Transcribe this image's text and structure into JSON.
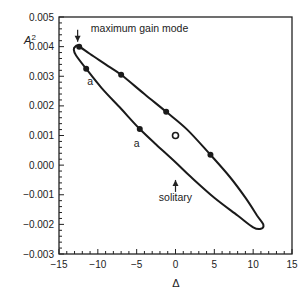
{
  "chart_data": {
    "type": "line",
    "title": "",
    "xlabel": "Δ",
    "ylabel": "A²",
    "xlim": [
      -15,
      15
    ],
    "ylim": [
      -0.003,
      0.005
    ],
    "x_ticks": [
      -15,
      -10,
      -5,
      0,
      5,
      10,
      15
    ],
    "x_tick_labels": [
      "−15",
      "−10",
      "−5",
      "0",
      "5",
      "10",
      "15"
    ],
    "y_ticks": [
      0.005,
      0.004,
      0.003,
      0.002,
      0.001,
      0.0,
      -0.001,
      -0.002,
      -0.003
    ],
    "y_tick_labels": [
      "0.005",
      "0.004",
      "0.003",
      "0.002",
      "0.001",
      "0.000",
      "−0.001",
      "−0.002",
      "−0.003"
    ],
    "grid": false,
    "series": [
      {
        "name": "closed curve (ellipse)",
        "style": "line",
        "points": [
          [
            -12.5,
            0.00402
          ],
          [
            -11.0,
            0.00375
          ],
          [
            -9.0,
            0.0034
          ],
          [
            -7.0,
            0.00305
          ],
          [
            -4.0,
            0.0024
          ],
          [
            -1.2,
            0.0018
          ],
          [
            1.5,
            0.0012
          ],
          [
            4.5,
            0.00035
          ],
          [
            7.0,
            -0.0004
          ],
          [
            9.0,
            -0.0011
          ],
          [
            10.5,
            -0.0017
          ],
          [
            11.3,
            -0.002
          ],
          [
            11.0,
            -0.00215
          ],
          [
            10.0,
            -0.0021
          ],
          [
            8.0,
            -0.0017
          ],
          [
            5.0,
            -0.0011
          ],
          [
            2.0,
            -0.0004
          ],
          [
            0.0,
            0.0001
          ],
          [
            -2.5,
            0.0007
          ],
          [
            -4.6,
            0.00122
          ],
          [
            -7.0,
            0.0019
          ],
          [
            -9.5,
            0.0026
          ],
          [
            -11.5,
            0.00325
          ],
          [
            -12.8,
            0.0037
          ],
          [
            -13.1,
            0.0039
          ],
          [
            -12.9,
            0.004
          ],
          [
            -12.5,
            0.00402
          ]
        ]
      },
      {
        "name": "marked points",
        "style": "filled-marker",
        "points": [
          [
            -12.4,
            0.004
          ],
          [
            -11.5,
            0.00325
          ],
          [
            -7.0,
            0.00305
          ],
          [
            -4.6,
            0.00122
          ],
          [
            -1.2,
            0.0018
          ],
          [
            4.5,
            0.00035
          ]
        ]
      },
      {
        "name": "solitary",
        "style": "open-marker",
        "points": [
          [
            0.0,
            0.001
          ]
        ]
      }
    ],
    "annotations": [
      {
        "text": "maximum gain mode",
        "x": -10.9,
        "y": 0.0045,
        "arrow_to": [
          -12.6,
          0.0041
        ]
      },
      {
        "text": "a",
        "x": -11.0,
        "y": 0.0027
      },
      {
        "text": "a",
        "x": -5.0,
        "y": 0.0006
      },
      {
        "text": "solitary",
        "x": 0.0,
        "y": -0.0012,
        "arrow_to": [
          0.0,
          -0.0005
        ]
      }
    ]
  }
}
